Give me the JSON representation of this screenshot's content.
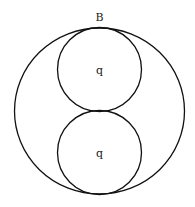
{
  "diagram": {
    "top_label": "B",
    "outer_circle": {
      "cx": 99.5,
      "cy": 111,
      "rx": 85,
      "ry": 83
    },
    "inner_circles": [
      {
        "label": "q",
        "cx": 99.5,
        "cy": 69.5,
        "r": 42
      },
      {
        "label": "q",
        "cx": 99.5,
        "cy": 152.5,
        "r": 42
      }
    ],
    "stroke_color": "#111111",
    "background": "#ffffff"
  }
}
